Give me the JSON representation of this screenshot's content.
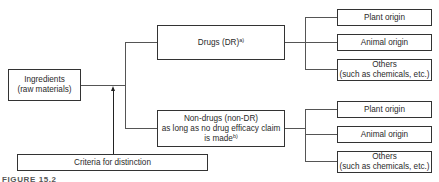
{
  "diagram": {
    "root": {
      "line1": "Ingredients",
      "line2": "(raw materials)"
    },
    "criteria": "Criteria for distinction",
    "drugs": {
      "label": "Drugs (DR)",
      "footnote": "a)"
    },
    "non_drugs": {
      "line1": "Non-drugs (non-DR)",
      "line2": "as long as no drug efficacy claim",
      "line3": "is made",
      "footnote": "b)"
    },
    "drug_children": [
      {
        "line1": "Plant origin"
      },
      {
        "line1": "Animal origin"
      },
      {
        "line1": "Others",
        "line2": "(such as chemicals, etc.)"
      }
    ],
    "nondrug_children": [
      {
        "line1": "Plant origin"
      },
      {
        "line1": "Animal origin"
      },
      {
        "line1": "Others",
        "line2": "(such as chemicals, etc.)"
      }
    ],
    "caption": "FIGURE 15.2"
  }
}
